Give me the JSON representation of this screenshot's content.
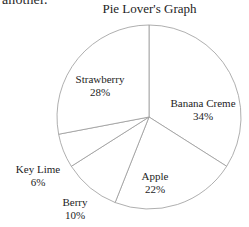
{
  "page": {
    "clipped_text_above": "another.",
    "background_color": "#ffffff"
  },
  "chart_data": {
    "type": "pie",
    "title": "Pie Lover's Graph",
    "xlabel": "",
    "ylabel": "",
    "grid": false,
    "legend": "none",
    "labels_position": "inline-around-slices",
    "start_angle_deg": 0,
    "direction": "clockwise",
    "stroke_color": "#9a9a9a",
    "fill_color": "#ffffff",
    "center": {
      "x": 149,
      "y": 117
    },
    "radius": 92,
    "categories": [
      "Banana Creme",
      "Apple",
      "Berry",
      "Key Lime",
      "Strawberry"
    ],
    "values": [
      34,
      22,
      10,
      6,
      28
    ],
    "units": "%",
    "slices": [
      {
        "name": "Banana Creme",
        "value": 34,
        "percent_label": "34%",
        "start_deg": 0.0,
        "end_deg": 122.4
      },
      {
        "name": "Apple",
        "value": 22,
        "percent_label": "22%",
        "start_deg": 122.4,
        "end_deg": 201.6
      },
      {
        "name": "Berry",
        "value": 10,
        "percent_label": "10%",
        "start_deg": 201.6,
        "end_deg": 237.6
      },
      {
        "name": "Key Lime",
        "value": 6,
        "percent_label": "6%",
        "start_deg": 237.6,
        "end_deg": 259.2
      },
      {
        "name": "Strawberry",
        "value": 28,
        "percent_label": "28%",
        "start_deg": 259.2,
        "end_deg": 360.0
      }
    ]
  },
  "labels": {
    "strawberry": {
      "name": "Strawberry",
      "pct": "28%"
    },
    "banana": {
      "name": "Banana Creme",
      "pct": "34%"
    },
    "apple": {
      "name": "Apple",
      "pct": "22%"
    },
    "keylime": {
      "name": "Key Lime",
      "pct": "6%"
    },
    "berry": {
      "name": "Berry",
      "pct": "10%"
    }
  }
}
